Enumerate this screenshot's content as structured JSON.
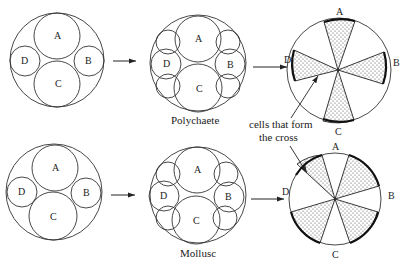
{
  "figure": {
    "rows": [
      {
        "name": "polychaete",
        "caption": "Polychaete",
        "stage1_labels": {
          "a": "A",
          "b": "B",
          "c": "C",
          "d": "D"
        },
        "stage2_labels": {
          "a": "A",
          "b": "B",
          "c": "C",
          "d": "D"
        },
        "stage3_labels": {
          "a": "A",
          "b": "B",
          "c": "C",
          "d": "D"
        },
        "cross_type": "radial cross (shaded sectors at A, B, C, D)"
      },
      {
        "name": "mollusc",
        "caption": "Mollusc",
        "stage1_labels": {
          "a": "A",
          "b": "B",
          "c": "C",
          "d": "D"
        },
        "stage2_labels": {
          "a": "A",
          "b": "B",
          "c": "C",
          "d": "D"
        },
        "stage3_labels": {
          "a": "A",
          "b": "B",
          "c": "C",
          "d": "D"
        },
        "cross_type": "interradial cross (shaded sectors between quadrants)"
      }
    ],
    "annotation": {
      "line1": "cells that form",
      "line2": "the cross"
    },
    "colors": {
      "stroke": "#333333",
      "background": "#ffffff",
      "stipple": "#444444"
    }
  }
}
